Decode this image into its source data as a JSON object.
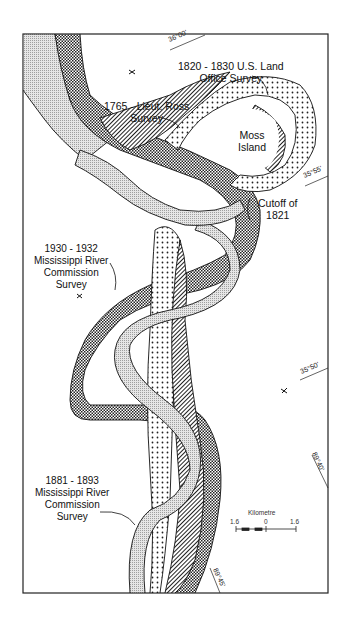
{
  "map": {
    "title": "Mississippi River channel positions near Moss Island",
    "surveys": [
      {
        "label_lines": [
          "1765 - Lieut. Ross",
          "Survey"
        ],
        "pattern": "diagonal-hatch"
      },
      {
        "label_lines": [
          "1820 - 1830 U.S. Land",
          "Office Survey"
        ],
        "pattern": "coarse-dots"
      },
      {
        "label_lines": [
          "1881 - 1893",
          "Mississippi River",
          "Commission",
          "Survey"
        ],
        "pattern": "fine-stipple"
      },
      {
        "label_lines": [
          "1930 - 1932",
          "Mississippi River",
          "Commission",
          "Survey"
        ],
        "pattern": "checker"
      }
    ],
    "features": {
      "island": [
        "Moss",
        "Island"
      ],
      "cutoff": [
        "Cutoff of",
        "1821"
      ]
    },
    "coordinates": {
      "lat_36_00": "36°00'",
      "lat_35_55": "35°55'",
      "lat_35_50": "35°50'",
      "lon_89_40": "89°40'",
      "lon_89_45": "89°45'"
    },
    "scale": {
      "unit": "Kilometre",
      "left": "1.6",
      "center": "0",
      "right": "1.6"
    }
  }
}
